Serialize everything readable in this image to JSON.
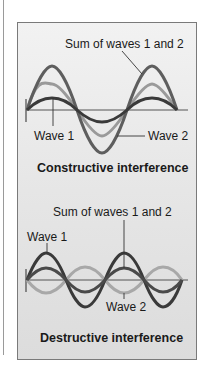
{
  "figure": {
    "constructive": {
      "title": "Constructive interference",
      "labels": {
        "sum": "Sum of waves 1 and 2",
        "wave1": "Wave 1",
        "wave2": "Wave 2"
      }
    },
    "destructive": {
      "title": "Destructive interference",
      "labels": {
        "sum": "Sum of waves 1 and 2",
        "wave1": "Wave 1",
        "wave2": "Wave 2"
      }
    },
    "colors": {
      "panel_border": "#7a7a7a",
      "axis": "#555555",
      "wave1_constructive": "#3a3a3a",
      "wave2_constructive": "#9a9a9a",
      "sum_constructive": "#5e5e5e",
      "wave1_destructive": "#3a3a3a",
      "wave2_destructive": "#a8a8a8",
      "sum_destructive": "#4a4a4a"
    }
  }
}
